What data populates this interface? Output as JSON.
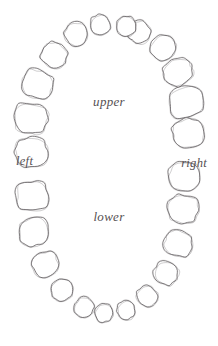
{
  "figure": {
    "kind": "dental-arch-diagram",
    "style": "hand-drawn pencil sketch",
    "background_color": "#ffffff",
    "stroke_color": "#5a5558"
  },
  "labels": {
    "upper": "upper",
    "lower": "lower",
    "left": "left",
    "right": "right"
  },
  "chart_data": {
    "type": "diagram",
    "title": "",
    "xlabel": "",
    "ylabel": "",
    "legend_position": "none",
    "grid": false,
    "annotations": [
      "upper",
      "lower",
      "left",
      "right"
    ],
    "arches": [
      {
        "name": "upper",
        "tooth_count": 16,
        "description": "upper dental arch, larger molars posterior, rounded incisors anterior"
      },
      {
        "name": "lower",
        "tooth_count": 16,
        "description": "lower dental arch, smaller triangular incisors anterior"
      }
    ],
    "teeth": [
      {
        "id": "UR8",
        "arch": "upper",
        "side": "right",
        "class": "molar",
        "cx": 186,
        "cy": 102,
        "rx": 17.0,
        "ry": 15.5,
        "rot": -16,
        "seed": 11
      },
      {
        "id": "UR7",
        "arch": "upper",
        "side": "right",
        "class": "molar",
        "cx": 188,
        "cy": 133,
        "rx": 16.0,
        "ry": 14.5,
        "rot": -6,
        "seed": 22
      },
      {
        "id": "UR6",
        "arch": "upper",
        "side": "right",
        "class": "molar",
        "cx": 178,
        "cy": 72,
        "rx": 14.5,
        "ry": 13.0,
        "rot": -28,
        "seed": 33
      },
      {
        "id": "UR5",
        "arch": "upper",
        "side": "right",
        "class": "premolar",
        "cx": 163,
        "cy": 48,
        "rx": 12.5,
        "ry": 12.0,
        "rot": -38,
        "seed": 44
      },
      {
        "id": "UR4",
        "arch": "upper",
        "side": "right",
        "class": "premolar",
        "cx": 139,
        "cy": 32,
        "rx": 11.0,
        "ry": 11.0,
        "rot": -52,
        "seed": 55
      },
      {
        "id": "UR3",
        "arch": "upper",
        "side": "right",
        "class": "canine",
        "cx": 126,
        "cy": 26,
        "rx": 10.0,
        "ry": 10.0,
        "rot": -62,
        "seed": 66
      },
      {
        "id": "UL3",
        "arch": "upper",
        "side": "left",
        "class": "canine",
        "cx": 100,
        "cy": 25,
        "rx": 10.5,
        "ry": 10.0,
        "rot": 62,
        "seed": 77
      },
      {
        "id": "UL4",
        "arch": "upper",
        "side": "left",
        "class": "premolar",
        "cx": 76,
        "cy": 34,
        "rx": 11.5,
        "ry": 11.5,
        "rot": 50,
        "seed": 88
      },
      {
        "id": "UL5",
        "arch": "upper",
        "side": "left",
        "class": "premolar",
        "cx": 54,
        "cy": 55,
        "rx": 13.0,
        "ry": 12.5,
        "rot": 36,
        "seed": 99
      },
      {
        "id": "UL6",
        "arch": "upper",
        "side": "left",
        "class": "molar",
        "cx": 37,
        "cy": 84,
        "rx": 15.5,
        "ry": 14.0,
        "rot": 22,
        "seed": 110
      },
      {
        "id": "UL7",
        "arch": "upper",
        "side": "left",
        "class": "molar",
        "cx": 31,
        "cy": 118,
        "rx": 16.5,
        "ry": 15.0,
        "rot": 8,
        "seed": 121
      },
      {
        "id": "UL8",
        "arch": "upper",
        "side": "left",
        "class": "molar",
        "cx": 31,
        "cy": 152,
        "rx": 16.0,
        "ry": 14.5,
        "rot": 0,
        "seed": 132
      },
      {
        "id": "LL8",
        "arch": "lower",
        "side": "left",
        "class": "molar",
        "cx": 32,
        "cy": 196,
        "rx": 16.0,
        "ry": 14.5,
        "rot": -4,
        "seed": 143
      },
      {
        "id": "LL7",
        "arch": "lower",
        "side": "left",
        "class": "molar",
        "cx": 34,
        "cy": 232,
        "rx": 15.0,
        "ry": 14.0,
        "rot": -12,
        "seed": 154
      },
      {
        "id": "LL6",
        "arch": "lower",
        "side": "left",
        "class": "molar",
        "cx": 45,
        "cy": 264,
        "rx": 13.0,
        "ry": 12.0,
        "rot": -24,
        "seed": 165
      },
      {
        "id": "LL5",
        "arch": "lower",
        "side": "left",
        "class": "premolar",
        "cx": 62,
        "cy": 290,
        "rx": 11.0,
        "ry": 10.5,
        "rot": -36,
        "seed": 176
      },
      {
        "id": "LL4",
        "arch": "lower",
        "side": "left",
        "class": "premolar",
        "cx": 84,
        "cy": 307,
        "rx": 10.0,
        "ry": 9.5,
        "rot": -48,
        "seed": 187
      },
      {
        "id": "LL3",
        "arch": "lower",
        "side": "left",
        "class": "incisor",
        "cx": 104,
        "cy": 313,
        "rx": 9.5,
        "ry": 9.0,
        "rot": -58,
        "seed": 198
      },
      {
        "id": "LR3",
        "arch": "lower",
        "side": "right",
        "class": "incisor",
        "cx": 126,
        "cy": 310,
        "rx": 9.5,
        "ry": 9.0,
        "rot": 58,
        "seed": 209
      },
      {
        "id": "LR4",
        "arch": "lower",
        "side": "right",
        "class": "premolar",
        "cx": 147,
        "cy": 296,
        "rx": 10.5,
        "ry": 10.0,
        "rot": 46,
        "seed": 220
      },
      {
        "id": "LR5",
        "arch": "lower",
        "side": "right",
        "class": "premolar",
        "cx": 166,
        "cy": 273,
        "rx": 12.0,
        "ry": 11.5,
        "rot": 32,
        "seed": 231
      },
      {
        "id": "LR6",
        "arch": "lower",
        "side": "right",
        "class": "molar",
        "cx": 178,
        "cy": 243,
        "rx": 14.0,
        "ry": 13.0,
        "rot": 18,
        "seed": 242
      },
      {
        "id": "LR7",
        "arch": "lower",
        "side": "right",
        "class": "molar",
        "cx": 183,
        "cy": 209,
        "rx": 15.0,
        "ry": 14.0,
        "rot": 6,
        "seed": 253
      },
      {
        "id": "LR8",
        "arch": "lower",
        "side": "right",
        "class": "molar",
        "cx": 184,
        "cy": 176,
        "rx": 15.0,
        "ry": 14.5,
        "rot": 0,
        "seed": 264
      }
    ]
  }
}
